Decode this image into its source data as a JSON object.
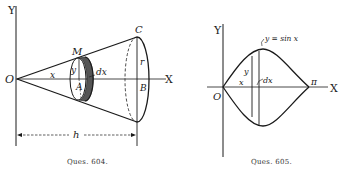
{
  "figures": [
    {
      "id": "604",
      "caption": "Ques. 604.",
      "labels": {
        "y_axis": "Y",
        "x_axis": "X",
        "origin": "O",
        "x": "x",
        "y": "y",
        "M": "M",
        "A": "A",
        "dx": "dx",
        "C": "C",
        "r": "r",
        "B": "B",
        "h": "h"
      }
    },
    {
      "id": "605",
      "caption": "Ques. 605.",
      "labels": {
        "y_axis": "Y",
        "x_axis": "X",
        "origin": "O",
        "curve": "y = sin x",
        "x": "x",
        "y": "y",
        "dx": "dx",
        "pi": "π"
      }
    }
  ],
  "colors": {
    "ink": "#1a1a1a",
    "background": "#ffffff"
  }
}
